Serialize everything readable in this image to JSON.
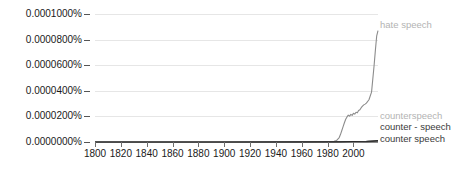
{
  "chart_data": {
    "type": "line",
    "title": "",
    "xlabel": "",
    "ylabel": "",
    "grid": true,
    "legend_position": "right-inline",
    "xlim": [
      1800,
      2019
    ],
    "ylim": [
      0.0,
      0.0001
    ],
    "xticks": [
      1800,
      1820,
      1840,
      1860,
      1880,
      1900,
      1920,
      1940,
      1960,
      1980,
      2000
    ],
    "xtick_labels": [
      "1800",
      "1820",
      "1840",
      "1860",
      "1880",
      "1900",
      "1920",
      "1940",
      "1960",
      "1980",
      "2000"
    ],
    "yticks": [
      0.0,
      2e-05,
      4e-05,
      6e-05,
      8e-05,
      0.0001
    ],
    "ytick_labels": [
      "0.0000000%",
      "0.0000200%",
      "0.0000400%",
      "0.0000600%",
      "0.0000800%",
      "0.0001000%"
    ],
    "series": [
      {
        "name": "hate speech",
        "color": "#8c8c8c",
        "label_color": "#b3b3b3",
        "x": [
          1800,
          1900,
          1940,
          1960,
          1975,
          1982,
          1985,
          1987,
          1989,
          1990,
          1991,
          1992,
          1993,
          1994,
          1995,
          1996,
          1997,
          1998,
          1999,
          2000,
          2001,
          2002,
          2003,
          2004,
          2005,
          2006,
          2007,
          2008,
          2009,
          2010,
          2012,
          2014,
          2016,
          2017,
          2018,
          2019
        ],
        "values": [
          0.0,
          0.0,
          0.0,
          0.0,
          0.0,
          2e-07,
          5e-07,
          1.2e-06,
          3.5e-06,
          6e-06,
          9e-06,
          1.2e-05,
          1.5e-05,
          1.78e-05,
          1.96e-05,
          2.1e-05,
          2.02e-05,
          2.16e-05,
          2.08e-05,
          2.24e-05,
          2.18e-05,
          2.32e-05,
          2.28e-05,
          2.46e-05,
          2.52e-05,
          2.68e-05,
          2.8e-05,
          2.9e-05,
          2.96e-05,
          3.04e-05,
          3.3e-05,
          3.9e-05,
          6e-05,
          7.2e-05,
          8.3e-05,
          8.7e-05
        ]
      },
      {
        "name": "counterspeech",
        "color": "#b3b3b3",
        "label_color": "#b3b3b3",
        "x": [
          1800,
          1900,
          1960,
          1990,
          2000,
          2010,
          2019
        ],
        "values": [
          0.0,
          0.0,
          0.0,
          1e-07,
          2e-07,
          4e-07,
          9e-07
        ]
      },
      {
        "name": "counter - speech",
        "color": "#3a3a3a",
        "label_color": "#3a3a3a",
        "x": [
          1800,
          1900,
          1960,
          1990,
          2000,
          2010,
          2019
        ],
        "values": [
          0.0,
          0.0,
          0.0,
          1e-07,
          2e-07,
          3e-07,
          6e-07
        ]
      },
      {
        "name": "counter speech",
        "color": "#2b2b2b",
        "label_color": "#3a3a3a",
        "x": [
          1800,
          1900,
          1960,
          1990,
          2000,
          2010,
          2019
        ],
        "values": [
          0.0,
          0.0,
          1e-07,
          2e-07,
          4e-07,
          6e-07,
          1.2e-06
        ]
      }
    ]
  },
  "legend": [
    {
      "label": "hate speech",
      "tone": "gray"
    },
    {
      "label": "counterspeech",
      "tone": "gray"
    },
    {
      "label": "counter - speech",
      "tone": "dark"
    },
    {
      "label": "counter speech",
      "tone": "dark"
    }
  ]
}
